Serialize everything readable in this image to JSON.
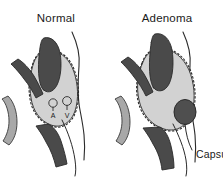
{
  "figure": {
    "background_color": "#ffffff",
    "panels": [
      {
        "id": "normal",
        "title": "Normal",
        "title_x": 56,
        "title_y": 22,
        "annotations": [
          {
            "id": "artery",
            "label": "A",
            "x": 53,
            "y": 113
          },
          {
            "id": "vein",
            "label": "V",
            "x": 67,
            "y": 113
          }
        ]
      },
      {
        "id": "adenoma",
        "title": "Adenoma",
        "title_x": 167,
        "title_y": 22,
        "annotations": [
          {
            "id": "capsule",
            "label": "Capsule",
            "x": 196,
            "y": 156
          }
        ]
      }
    ]
  },
  "colors": {
    "background": "#ffffff",
    "gland_fill": "#d2d2d2",
    "gland_outline": "#3a3a3a",
    "vessel_dark": "#4a4a4a",
    "vessel_mid": "#9a9a9a",
    "muscle_gray": "#a8a8a8",
    "nodule_dark": "#4f4f4f",
    "outline_black": "#2a2a2a",
    "text": "#1a1a1a",
    "leader_line": "#2a2a2a"
  }
}
